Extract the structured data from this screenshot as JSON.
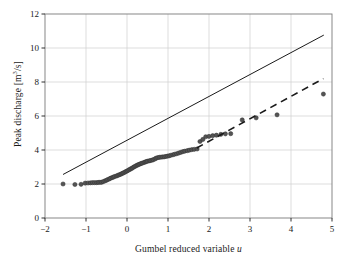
{
  "chart_data": {
    "type": "scatter",
    "title": "",
    "subtitle": "",
    "xlabel": "Gumbel reduced variable u",
    "xlabel_plain": "Gumbel reduced variable",
    "xlabel_italic_symbol": "u",
    "ylabel": "Peak discharge [m³/s]",
    "ylabel_prefix": "Peak discharge [m",
    "ylabel_exponent": "3",
    "ylabel_suffix": "/s]",
    "xlim": [
      -2,
      5
    ],
    "ylim": [
      0,
      12
    ],
    "xticks": [
      -2,
      -1,
      0,
      1,
      2,
      3,
      4,
      5
    ],
    "xtick_labels": [
      "−2",
      "−1",
      "0",
      "1",
      "2",
      "3",
      "4",
      "5"
    ],
    "yticks": [
      0,
      2,
      4,
      6,
      8,
      10,
      12
    ],
    "ytick_labels": [
      "0",
      "2",
      "4",
      "6",
      "8",
      "10",
      "12"
    ],
    "grid": true,
    "grid_color": "#cfcfcf",
    "frame_color": "#7a7a7a",
    "legend": "none",
    "marker_color": "#545454",
    "marker_edge_color": "#2e2e2e",
    "marker_size_px": 4.2,
    "series": [
      {
        "name": "Observed annual peak discharge",
        "type": "scatter",
        "marker": "circle",
        "color": "#545454",
        "x": [
          -1.56,
          -1.27,
          -1.12,
          -1.02,
          -0.95,
          -0.89,
          -0.84,
          -0.79,
          -0.74,
          -0.7,
          -0.66,
          -0.62,
          -0.58,
          -0.54,
          -0.5,
          -0.47,
          -0.43,
          -0.4,
          -0.36,
          -0.33,
          -0.3,
          -0.26,
          -0.23,
          -0.2,
          -0.17,
          -0.14,
          -0.11,
          -0.08,
          -0.05,
          -0.02,
          0.01,
          0.04,
          0.07,
          0.1,
          0.13,
          0.16,
          0.19,
          0.22,
          0.25,
          0.28,
          0.31,
          0.34,
          0.37,
          0.41,
          0.44,
          0.47,
          0.5,
          0.54,
          0.57,
          0.61,
          0.64,
          0.68,
          0.71,
          0.75,
          0.79,
          0.83,
          0.87,
          0.91,
          0.95,
          0.99,
          1.03,
          1.07,
          1.12,
          1.16,
          1.21,
          1.26,
          1.31,
          1.36,
          1.41,
          1.47,
          1.52,
          1.58,
          1.64,
          1.71,
          1.78,
          1.85,
          1.92,
          2.0,
          2.09,
          2.18,
          2.29,
          2.4,
          2.53,
          2.81,
          3.15,
          3.66,
          4.79
        ],
        "y": [
          2.0,
          1.97,
          1.98,
          2.05,
          2.06,
          2.07,
          2.08,
          2.08,
          2.08,
          2.09,
          2.1,
          2.1,
          2.14,
          2.18,
          2.22,
          2.26,
          2.3,
          2.34,
          2.38,
          2.41,
          2.44,
          2.47,
          2.5,
          2.53,
          2.56,
          2.59,
          2.63,
          2.66,
          2.7,
          2.74,
          2.78,
          2.82,
          2.86,
          2.9,
          2.94,
          2.99,
          3.03,
          3.07,
          3.11,
          3.14,
          3.17,
          3.2,
          3.23,
          3.26,
          3.29,
          3.32,
          3.34,
          3.36,
          3.38,
          3.4,
          3.43,
          3.47,
          3.52,
          3.55,
          3.57,
          3.58,
          3.59,
          3.6,
          3.62,
          3.64,
          3.66,
          3.69,
          3.72,
          3.75,
          3.78,
          3.82,
          3.86,
          3.9,
          3.93,
          3.96,
          3.99,
          4.02,
          4.04,
          4.06,
          4.5,
          4.62,
          4.78,
          4.8,
          4.84,
          4.87,
          4.92,
          4.95,
          4.96,
          5.77,
          5.89,
          6.07,
          7.29
        ]
      },
      {
        "name": "Reference line (solid)",
        "type": "line",
        "style": "solid",
        "color": "#1a1a1a",
        "x": [
          -1.56,
          4.8
        ],
        "y": [
          2.56,
          10.76
        ]
      },
      {
        "name": "Fitted upper-tail line (dashed)",
        "type": "line",
        "style": "dashed",
        "color": "#1a1a1a",
        "x": [
          1.7,
          4.79
        ],
        "y": [
          4.12,
          8.2
        ]
      }
    ]
  },
  "figure": {
    "background": "#ffffff",
    "axes_background": "#ffffff"
  }
}
